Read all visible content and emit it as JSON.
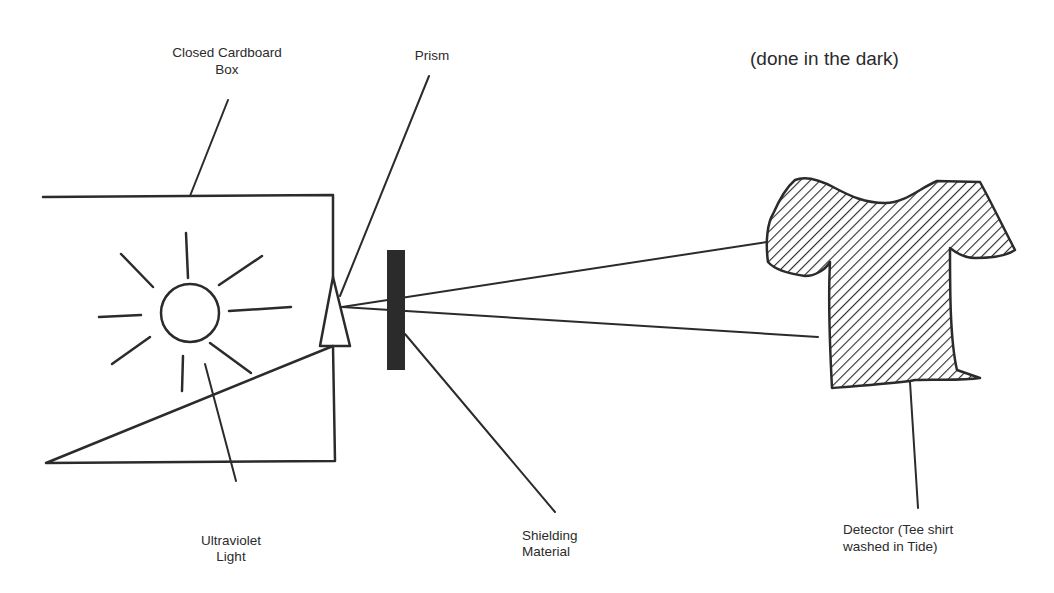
{
  "diagram": {
    "type": "experiment-setup",
    "note": "(done in the dark)",
    "labels": {
      "box": [
        "Closed Cardboard",
        "Box"
      ],
      "prism": "Prism",
      "light": [
        "Ultraviolet",
        "Light"
      ],
      "shield": [
        "Shielding",
        "Material"
      ],
      "detector": [
        "Detector (Tee shirt",
        "washed in Tide)"
      ]
    },
    "components": [
      {
        "id": "box",
        "name": "Closed Cardboard Box",
        "shape": "rectangle"
      },
      {
        "id": "light",
        "name": "Ultraviolet Light",
        "shape": "sun"
      },
      {
        "id": "prism",
        "name": "Prism",
        "shape": "triangle"
      },
      {
        "id": "shield",
        "name": "Shielding Material",
        "shape": "filled-bar"
      },
      {
        "id": "detector",
        "name": "Detector (Tee shirt washed in Tide)",
        "shape": "hatched-tshirt"
      }
    ],
    "connections": [
      {
        "from": "prism",
        "to": "detector",
        "kind": "light-ray-upper"
      },
      {
        "from": "prism",
        "to": "detector",
        "kind": "light-ray-lower"
      }
    ],
    "colors": {
      "ink": "#2b2b2b",
      "background": "#ffffff"
    }
  }
}
